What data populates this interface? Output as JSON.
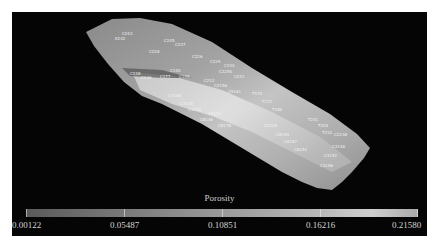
{
  "legend": {
    "title": "Porosity",
    "ticks": [
      "0.00122",
      "0.05487",
      "0.10851",
      "0.16216",
      "0.21580"
    ]
  },
  "colors": {
    "background": "#050505",
    "frame": "#ffffff",
    "model_light": "#cdcdcd",
    "model_dark": "#6e6e6e"
  },
  "wells": [
    {
      "name": "C243",
      "x": 110,
      "y": 20
    },
    {
      "name": "K242",
      "x": 103,
      "y": 25
    },
    {
      "name": "C245",
      "x": 152,
      "y": 27
    },
    {
      "name": "C237",
      "x": 163,
      "y": 31
    },
    {
      "name": "C228",
      "x": 137,
      "y": 38
    },
    {
      "name": "C226",
      "x": 180,
      "y": 43
    },
    {
      "name": "C229",
      "x": 198,
      "y": 48
    },
    {
      "name": "C232",
      "x": 212,
      "y": 52
    },
    {
      "name": "C2250",
      "x": 207,
      "y": 58
    },
    {
      "name": "C231",
      "x": 222,
      "y": 63
    },
    {
      "name": "C140",
      "x": 158,
      "y": 57
    },
    {
      "name": "C177",
      "x": 148,
      "y": 63
    },
    {
      "name": "C145",
      "x": 167,
      "y": 63
    },
    {
      "name": "C138",
      "x": 118,
      "y": 60
    },
    {
      "name": "C136",
      "x": 129,
      "y": 64
    },
    {
      "name": "C212",
      "x": 192,
      "y": 67
    },
    {
      "name": "C2156",
      "x": 202,
      "y": 72
    },
    {
      "name": "T174",
      "x": 240,
      "y": 80
    },
    {
      "name": "T172",
      "x": 250,
      "y": 88
    },
    {
      "name": "T180",
      "x": 260,
      "y": 96
    },
    {
      "name": "T231",
      "x": 296,
      "y": 106
    },
    {
      "name": "T204",
      "x": 306,
      "y": 112
    },
    {
      "name": "T212",
      "x": 310,
      "y": 119
    },
    {
      "name": "C2238",
      "x": 322,
      "y": 121
    },
    {
      "name": "C3146",
      "x": 320,
      "y": 133
    },
    {
      "name": "C3152",
      "x": 312,
      "y": 142
    },
    {
      "name": "C3186",
      "x": 308,
      "y": 152
    },
    {
      "name": "C9161",
      "x": 216,
      "y": 78
    },
    {
      "name": "C2125",
      "x": 252,
      "y": 112
    },
    {
      "name": "C8193",
      "x": 264,
      "y": 121
    },
    {
      "name": "C8187",
      "x": 272,
      "y": 128
    },
    {
      "name": "C8151",
      "x": 282,
      "y": 136
    },
    {
      "name": "C9151",
      "x": 196,
      "y": 100
    },
    {
      "name": "C8146",
      "x": 188,
      "y": 106
    },
    {
      "name": "C8176",
      "x": 206,
      "y": 112
    },
    {
      "name": "C3158",
      "x": 168,
      "y": 90
    },
    {
      "name": "C3168",
      "x": 156,
      "y": 82
    },
    {
      "name": "C3143",
      "x": 176,
      "y": 96
    }
  ]
}
